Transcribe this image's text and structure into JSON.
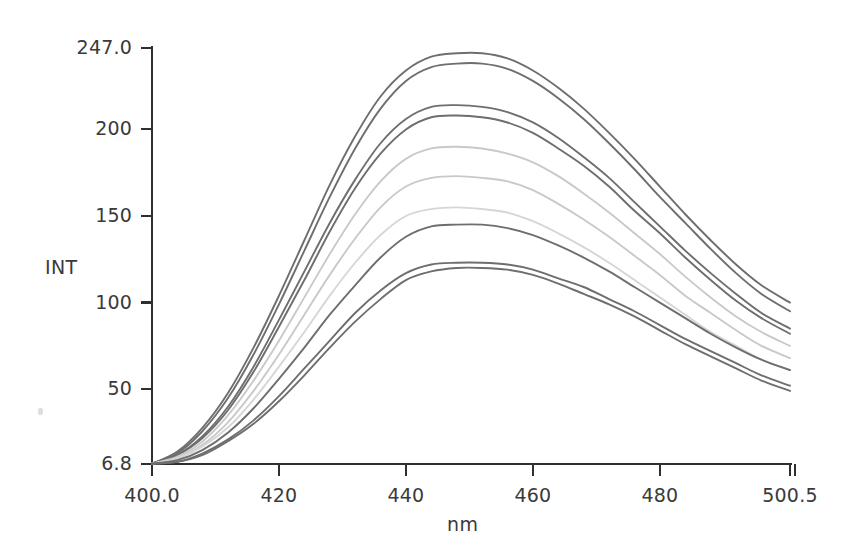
{
  "chart_data": {
    "type": "line",
    "title": "",
    "xlabel": "nm",
    "ylabel": "INT",
    "xlim": [
      400.0,
      500.5
    ],
    "ylim": [
      6.8,
      247.0
    ],
    "grid": false,
    "legend": "none",
    "x_tick_labels": [
      "400.0",
      "420",
      "440",
      "460",
      "480",
      "500.5"
    ],
    "x_tick_values": [
      400.0,
      420,
      440,
      460,
      480,
      500.5
    ],
    "y_tick_labels": [
      "247.0",
      "200",
      "150",
      "100",
      "50",
      "6.8"
    ],
    "y_tick_values": [
      247.0,
      200,
      150,
      100,
      50,
      6.8
    ],
    "x": [
      400,
      404,
      408,
      412,
      416,
      420,
      424,
      428,
      432,
      436,
      440,
      444,
      448,
      452,
      456,
      460,
      464,
      468,
      472,
      476,
      480,
      484,
      488,
      492,
      496,
      500.5
    ],
    "series": [
      {
        "name": "curve-1",
        "color": "#6e6e6e",
        "peak_nm": 452,
        "peak_int": 244,
        "values": [
          7,
          14,
          28,
          48,
          74,
          104,
          136,
          168,
          196,
          219,
          234,
          242,
          244,
          244,
          241,
          234,
          224,
          212,
          198,
          183,
          167,
          151,
          136,
          122,
          110,
          100
        ]
      },
      {
        "name": "curve-2",
        "color": "#6e6e6e",
        "peak_nm": 452,
        "peak_int": 238,
        "values": [
          7,
          13,
          26,
          45,
          70,
          99,
          130,
          161,
          189,
          212,
          228,
          236,
          238,
          238,
          235,
          228,
          218,
          206,
          192,
          177,
          161,
          146,
          131,
          117,
          105,
          95
        ]
      },
      {
        "name": "curve-3",
        "color": "#6e6e6e",
        "peak_nm": 452,
        "peak_int": 214,
        "values": [
          7,
          12,
          23,
          40,
          63,
          90,
          118,
          146,
          171,
          192,
          206,
          213,
          214,
          213,
          210,
          204,
          195,
          184,
          172,
          158,
          144,
          130,
          117,
          105,
          94,
          85
        ]
      },
      {
        "name": "curve-4",
        "color": "#6e6e6e",
        "peak_nm": 452,
        "peak_int": 208,
        "values": [
          7,
          12,
          22,
          38,
          60,
          86,
          113,
          141,
          166,
          186,
          200,
          207,
          208,
          207,
          204,
          198,
          189,
          179,
          167,
          153,
          140,
          126,
          113,
          101,
          91,
          82
        ]
      },
      {
        "name": "curve-5",
        "color": "#c9c9c9",
        "peak_nm": 452,
        "peak_int": 190,
        "values": [
          7,
          11,
          20,
          35,
          55,
          78,
          103,
          128,
          151,
          170,
          183,
          189,
          190,
          189,
          186,
          181,
          173,
          163,
          152,
          140,
          128,
          115,
          103,
          92,
          83,
          75
        ]
      },
      {
        "name": "curve-6",
        "color": "#c9c9c9",
        "peak_nm": 452,
        "peak_int": 173,
        "values": [
          7,
          10,
          18,
          31,
          49,
          70,
          93,
          116,
          137,
          155,
          167,
          172,
          173,
          172,
          170,
          165,
          157,
          148,
          138,
          127,
          116,
          104,
          94,
          84,
          75,
          68
        ]
      },
      {
        "name": "curve-7",
        "color": "#d6d6d6",
        "peak_nm": 452,
        "peak_int": 155,
        "values": [
          7,
          10,
          17,
          28,
          44,
          63,
          83,
          104,
          123,
          139,
          150,
          154,
          155,
          154,
          152,
          147,
          140,
          132,
          123,
          113,
          103,
          93,
          83,
          75,
          67,
          61
        ]
      },
      {
        "name": "curve-8",
        "color": "#6e6e6e",
        "peak_nm": 452,
        "peak_int": 145,
        "values": [
          7,
          9,
          15,
          25,
          39,
          56,
          74,
          93,
          110,
          126,
          138,
          144,
          145,
          145,
          143,
          139,
          133,
          126,
          118,
          109,
          100,
          91,
          82,
          74,
          67,
          61
        ]
      },
      {
        "name": "curve-9",
        "color": "#6e6e6e",
        "peak_nm": 452,
        "peak_int": 123,
        "values": [
          7,
          8,
          13,
          21,
          32,
          46,
          62,
          78,
          94,
          107,
          117,
          122,
          123,
          123,
          122,
          119,
          114,
          109,
          102,
          95,
          87,
          79,
          72,
          65,
          58,
          52
        ]
      },
      {
        "name": "curve-10",
        "color": "#6e6e6e",
        "peak_nm": 452,
        "peak_int": 120,
        "values": [
          7,
          8,
          12,
          20,
          30,
          43,
          58,
          74,
          89,
          102,
          113,
          118,
          120,
          120,
          119,
          116,
          111,
          105,
          99,
          92,
          84,
          76,
          69,
          62,
          55,
          49
        ]
      }
    ]
  },
  "axes": {
    "y_axis_title": "INT",
    "x_axis_title": "nm"
  },
  "colors": {
    "axis": "#2f2f2f",
    "dark_trace": "#6e6e6e",
    "light_trace": "#c9c9c9",
    "background": "#ffffff"
  }
}
